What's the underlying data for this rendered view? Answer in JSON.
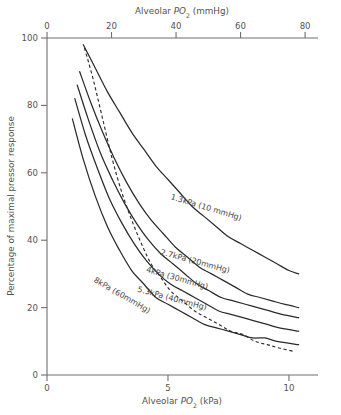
{
  "chart_data": {
    "type": "line",
    "title": "",
    "xlabel": "Alveolar PO2 (kPa)",
    "xlabel_top": "Alveolar PO2 (mmHg)",
    "ylabel": "Percentage of maximal pressor response",
    "xlim": [
      0,
      11.2
    ],
    "xlim_top": [
      0,
      84
    ],
    "ylim": [
      0,
      100
    ],
    "xticks": [
      0,
      5,
      10
    ],
    "xticklabels": [
      "0",
      "5",
      "10"
    ],
    "xticks_top": [
      0,
      20,
      40,
      60,
      80
    ],
    "xticklabels_top": [
      "0",
      "20",
      "40",
      "60",
      "80"
    ],
    "yticks": [
      0,
      20,
      40,
      60,
      80,
      100
    ],
    "yticklabels": [
      "0",
      "20",
      "40",
      "60",
      "80",
      "100"
    ],
    "grid": false,
    "legend_position": "inline-curve-labels",
    "series": [
      {
        "name": "1.3kPa (10 mmHg)",
        "style": "solid",
        "label": "1.3kPa (10 mmHg)",
        "points": [
          [
            1.5,
            98
          ],
          [
            2.0,
            91
          ],
          [
            2.5,
            84
          ],
          [
            3.0,
            78
          ],
          [
            3.5,
            72
          ],
          [
            4.0,
            67
          ],
          [
            4.5,
            62
          ],
          [
            5.0,
            58
          ],
          [
            5.5,
            54
          ],
          [
            6.0,
            50
          ],
          [
            6.5,
            47
          ],
          [
            7.0,
            44
          ],
          [
            7.5,
            41
          ],
          [
            8.0,
            39
          ],
          [
            8.5,
            37
          ],
          [
            9.0,
            35
          ],
          [
            9.5,
            33
          ],
          [
            10.0,
            31
          ],
          [
            10.4,
            30
          ]
        ]
      },
      {
        "name": "2.7kPa (20 mmHg)",
        "style": "solid",
        "label": "2.7kPa (20mmHg)",
        "points": [
          [
            1.35,
            90
          ],
          [
            1.8,
            81
          ],
          [
            2.3,
            72
          ],
          [
            2.8,
            64
          ],
          [
            3.3,
            57
          ],
          [
            3.8,
            51
          ],
          [
            4.3,
            46
          ],
          [
            4.8,
            42
          ],
          [
            5.3,
            38
          ],
          [
            5.8,
            35
          ],
          [
            6.3,
            32
          ],
          [
            6.8,
            30
          ],
          [
            7.3,
            28
          ],
          [
            7.8,
            26
          ],
          [
            8.3,
            24
          ],
          [
            8.8,
            23
          ],
          [
            9.3,
            22
          ],
          [
            9.8,
            21
          ],
          [
            10.4,
            20
          ]
        ]
      },
      {
        "name": "4kPa (30mmHg)",
        "style": "solid",
        "label": "4kPa (30mmHg)",
        "points": [
          [
            1.25,
            86
          ],
          [
            1.7,
            76
          ],
          [
            2.2,
            66
          ],
          [
            2.7,
            58
          ],
          [
            3.2,
            51
          ],
          [
            3.7,
            45
          ],
          [
            4.2,
            40
          ],
          [
            4.7,
            36
          ],
          [
            5.2,
            33
          ],
          [
            5.7,
            30
          ],
          [
            6.2,
            27
          ],
          [
            6.7,
            25
          ],
          [
            7.2,
            23
          ],
          [
            7.7,
            22
          ],
          [
            8.2,
            21
          ],
          [
            8.7,
            20
          ],
          [
            9.2,
            19
          ],
          [
            9.7,
            18
          ],
          [
            10.4,
            17
          ]
        ]
      },
      {
        "name": "5.3kPa (40mmHg)",
        "style": "solid",
        "label": "5.3kPa (40mmHg)",
        "points": [
          [
            1.15,
            82
          ],
          [
            1.6,
            71
          ],
          [
            2.1,
            61
          ],
          [
            2.6,
            52
          ],
          [
            3.1,
            45
          ],
          [
            3.6,
            39
          ],
          [
            4.1,
            34
          ],
          [
            4.6,
            30
          ],
          [
            5.1,
            27
          ],
          [
            5.6,
            25
          ],
          [
            6.1,
            23
          ],
          [
            6.6,
            21
          ],
          [
            7.1,
            19
          ],
          [
            7.6,
            18
          ],
          [
            8.1,
            17
          ],
          [
            8.6,
            16
          ],
          [
            9.1,
            15
          ],
          [
            9.6,
            14
          ],
          [
            10.4,
            13
          ]
        ]
      },
      {
        "name": "8kPa (60mmHg)",
        "style": "solid",
        "label": "8kPa (60mmHg)",
        "points": [
          [
            1.05,
            76
          ],
          [
            1.5,
            64
          ],
          [
            2.0,
            53
          ],
          [
            2.5,
            44
          ],
          [
            3.0,
            37
          ],
          [
            3.5,
            31
          ],
          [
            4.0,
            27
          ],
          [
            4.5,
            23
          ],
          [
            5.0,
            21
          ],
          [
            5.5,
            19
          ],
          [
            6.0,
            17
          ],
          [
            6.5,
            15
          ],
          [
            7.0,
            14
          ],
          [
            7.5,
            13
          ],
          [
            8.0,
            12
          ],
          [
            8.5,
            11
          ],
          [
            9.0,
            11
          ],
          [
            9.5,
            10
          ],
          [
            10.4,
            9
          ]
        ]
      },
      {
        "name": "physiological-response",
        "style": "dashed",
        "label": "",
        "points": [
          [
            1.55,
            97
          ],
          [
            1.9,
            88
          ],
          [
            2.3,
            76
          ],
          [
            2.7,
            64
          ],
          [
            3.1,
            54
          ],
          [
            3.5,
            46
          ],
          [
            3.9,
            39
          ],
          [
            4.3,
            33
          ],
          [
            4.7,
            29
          ],
          [
            5.1,
            25
          ],
          [
            5.6,
            22
          ],
          [
            6.1,
            19
          ],
          [
            6.6,
            17
          ],
          [
            7.1,
            15
          ],
          [
            7.6,
            13
          ],
          [
            8.1,
            12
          ],
          [
            8.6,
            10
          ],
          [
            9.1,
            9
          ],
          [
            9.6,
            8
          ],
          [
            10.2,
            7
          ]
        ]
      }
    ]
  },
  "axes": {
    "top_title_prefix": "Alveolar ",
    "top_title_italic": "P",
    "top_title_sub": "O",
    "top_title_sub2": "2",
    "top_title_suffix": " (mmHg)",
    "bottom_title_prefix": "Alveolar ",
    "bottom_title_italic": "P",
    "bottom_title_sub": "O",
    "bottom_title_sub2": "2",
    "bottom_title_suffix": " (kPa)",
    "ylabel": "Percentage of maximal pressor response"
  },
  "colors": {
    "curve": "#2b2b2b",
    "axis": "#6e6e6e",
    "text": "#55514f",
    "background": "#ffffff"
  }
}
